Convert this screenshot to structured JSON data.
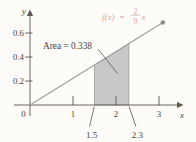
{
  "chart_data": {
    "type": "area",
    "title": "",
    "function_label": {
      "lhs": "f(x)",
      "equals": "=",
      "numerator": "2",
      "denominator": "9",
      "variable": "x"
    },
    "line": {
      "name": "f(x) = (2/9)x",
      "slope_num": 2,
      "slope_den": 9,
      "points": [
        {
          "x": 0,
          "y": 0
        },
        {
          "x": 3.09,
          "y": 0.687
        }
      ],
      "endpoint_dot": true
    },
    "region": {
      "x_start": 1.5,
      "x_end": 2.3,
      "y_at_start": 0.333,
      "y_at_end": 0.511,
      "area": 0.338,
      "boundary_labels": [
        "1.5",
        "2.3"
      ]
    },
    "annotation": {
      "text": "Area = 0.338"
    },
    "axes": {
      "x_label": "x",
      "y_label": "y",
      "origin_label": "0",
      "x_ticks": [
        {
          "value": 1,
          "label": "1"
        },
        {
          "value": 2,
          "label": "2"
        },
        {
          "value": 3,
          "label": "3"
        }
      ],
      "y_ticks": [
        {
          "value": 0.2,
          "label": "0.2"
        },
        {
          "value": 0.4,
          "label": "0.4"
        },
        {
          "value": 0.6,
          "label": "0.6"
        }
      ],
      "xlim": [
        0,
        3.45
      ],
      "ylim": [
        0,
        0.79
      ],
      "grid": false
    },
    "colors": {
      "background": "#fdfcf8",
      "axis": "#5f564c",
      "text": "#4a4138",
      "function_label": "#d9a39d",
      "line": "#9e9e9e",
      "region_fill": "#c8c8c8",
      "region_stroke": "#979797",
      "dot": "#8d8a87"
    }
  }
}
